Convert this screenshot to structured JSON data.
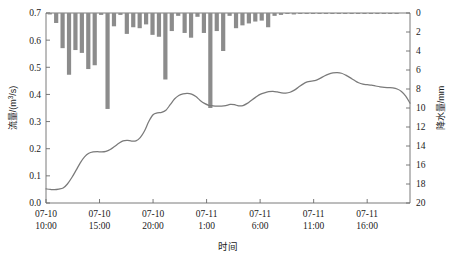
{
  "chart_data": {
    "type": "bar",
    "title": "",
    "xlabel": "时间",
    "ylabel_left": "流量/(m³/s)",
    "ylabel_left_parts": {
      "prefix": "流量/(m",
      "sup": "3",
      "suffix": "/s)"
    },
    "ylabel_right": "降水量/mm",
    "grid": false,
    "legend": "none",
    "x_tick_labels": [
      {
        "line1": "07-10",
        "line2": "10:00"
      },
      {
        "line1": "07-10",
        "line2": "15:00"
      },
      {
        "line1": "07-10",
        "line2": "20:00"
      },
      {
        "line1": "07-11",
        "line2": "1:00"
      },
      {
        "line1": "07-11",
        "line2": "6:00"
      },
      {
        "line1": "07-11",
        "line2": "11:00"
      },
      {
        "line1": "07-11",
        "line2": "16:00"
      }
    ],
    "x_tick_hours": [
      0,
      5,
      10,
      15,
      20,
      25,
      30
    ],
    "x_range_hours": [
      0,
      34
    ],
    "left_axis": {
      "min": 0.0,
      "max": 0.7,
      "step": 0.1,
      "ticks": [
        "0.0",
        "0.1",
        "0.2",
        "0.3",
        "0.4",
        "0.5",
        "0.6",
        "0.7"
      ]
    },
    "right_axis": {
      "min": 0,
      "max": 20,
      "step": 2,
      "inverted": true,
      "ticks": [
        "0",
        "2",
        "4",
        "6",
        "8",
        "10",
        "12",
        "14",
        "16",
        "18",
        "20"
      ]
    },
    "series": [
      {
        "name": "降水量",
        "type": "bar",
        "axis": "right",
        "color": "#8c8c8c",
        "x": [
          0.35,
          0.95,
          1.55,
          2.15,
          2.75,
          3.35,
          3.95,
          4.55,
          5.15,
          5.75,
          6.35,
          6.95,
          7.55,
          8.15,
          8.75,
          9.35,
          9.95,
          10.55,
          11.15,
          11.75,
          12.35,
          12.95,
          13.55,
          14.15,
          14.75,
          15.35,
          15.95,
          16.55,
          17.15,
          17.75,
          18.35,
          18.95,
          19.55,
          20.15,
          20.75,
          21.35,
          21.95,
          22.55,
          23.15,
          23.75,
          24.35,
          24.95,
          25.55,
          26.15,
          26.75,
          27.35,
          27.95,
          28.55,
          29.15,
          29.75,
          30.35,
          30.95,
          31.55,
          32.15,
          32.75
        ],
        "values": [
          0.15,
          1.05,
          3.7,
          6.5,
          3.9,
          4.2,
          5.9,
          5.5,
          0.2,
          10.1,
          1.4,
          0.2,
          2.2,
          1.5,
          1.6,
          1.2,
          2.3,
          2.5,
          7.0,
          1.9,
          0.3,
          2.1,
          2.6,
          0.4,
          2.1,
          10.0,
          1.9,
          4.0,
          0.3,
          1.6,
          1.3,
          1.1,
          0.9,
          0.8,
          1.5,
          0.3,
          0.2,
          0.1,
          0.15,
          0.1,
          0.05,
          0.05,
          0.1,
          0.05,
          0.05,
          0.05,
          0.05,
          0.05,
          0.05,
          0.05,
          0.05,
          0.05,
          0.05,
          0.05,
          0.05
        ]
      },
      {
        "name": "流量",
        "type": "line",
        "axis": "left",
        "color": "#7a7a7a",
        "x": [
          0.0,
          0.4,
          0.8,
          1.2,
          1.6,
          2.0,
          2.4,
          2.8,
          3.2,
          3.6,
          4.0,
          4.4,
          4.8,
          5.2,
          5.6,
          6.0,
          6.4,
          6.8,
          7.2,
          7.6,
          8.0,
          8.4,
          8.8,
          9.2,
          9.6,
          10.0,
          10.4,
          10.8,
          11.2,
          11.6,
          12.0,
          12.4,
          12.8,
          13.2,
          13.6,
          14.0,
          14.4,
          14.8,
          15.2,
          15.6,
          16.0,
          16.4,
          16.8,
          17.2,
          17.6,
          18.0,
          18.4,
          18.8,
          19.2,
          19.6,
          20.0,
          20.4,
          20.8,
          21.2,
          21.6,
          22.0,
          22.4,
          22.8,
          23.2,
          23.6,
          24.0,
          24.4,
          24.8,
          25.2,
          25.6,
          26.0,
          26.4,
          26.8,
          27.2,
          27.6,
          28.0,
          28.4,
          28.8,
          29.2,
          29.6,
          30.0,
          30.4,
          30.8,
          31.2,
          31.6,
          32.0,
          32.4,
          32.8,
          33.2,
          33.6,
          34.0
        ],
        "values": [
          0.052,
          0.05,
          0.049,
          0.051,
          0.055,
          0.07,
          0.093,
          0.12,
          0.148,
          0.17,
          0.183,
          0.188,
          0.189,
          0.188,
          0.19,
          0.197,
          0.208,
          0.22,
          0.229,
          0.231,
          0.228,
          0.229,
          0.241,
          0.265,
          0.3,
          0.325,
          0.332,
          0.334,
          0.342,
          0.362,
          0.383,
          0.396,
          0.402,
          0.404,
          0.401,
          0.392,
          0.378,
          0.367,
          0.36,
          0.358,
          0.357,
          0.357,
          0.359,
          0.363,
          0.362,
          0.358,
          0.359,
          0.367,
          0.379,
          0.39,
          0.4,
          0.406,
          0.41,
          0.411,
          0.409,
          0.406,
          0.405,
          0.408,
          0.416,
          0.427,
          0.438,
          0.446,
          0.449,
          0.452,
          0.459,
          0.468,
          0.475,
          0.479,
          0.48,
          0.478,
          0.471,
          0.462,
          0.452,
          0.443,
          0.438,
          0.436,
          0.434,
          0.431,
          0.428,
          0.426,
          0.425,
          0.424,
          0.42,
          0.411,
          0.394,
          0.368
        ]
      }
    ]
  },
  "colors": {
    "bar": "#8c8c8c",
    "line": "#7a7a7a",
    "axis": "#6b6b6b",
    "text": "#1a1a1a"
  }
}
